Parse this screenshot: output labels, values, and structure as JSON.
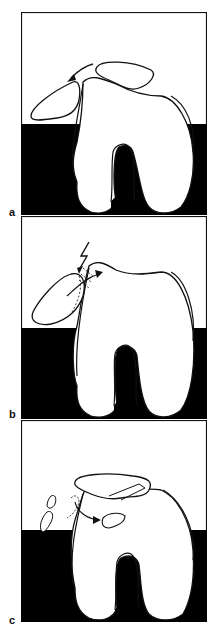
{
  "figure": {
    "panels": [
      {
        "label": "a",
        "description": "Patella dislocating laterally over femoral condyle",
        "arrow": "curved arrow indicating lateral dislocation direction"
      },
      {
        "label": "b",
        "description": "Impact of patella on lateral femoral condyle with osteochondral fracture",
        "symbol": "lightning bolt (impact)"
      },
      {
        "label": "c",
        "description": "Relocated patella with osteochondral fragments and loose body",
        "arrow": "curved arrow indicating fragment displacement into joint"
      }
    ],
    "colors": {
      "ink": "#111111",
      "background": "#ffffff",
      "band": "#000000"
    }
  }
}
